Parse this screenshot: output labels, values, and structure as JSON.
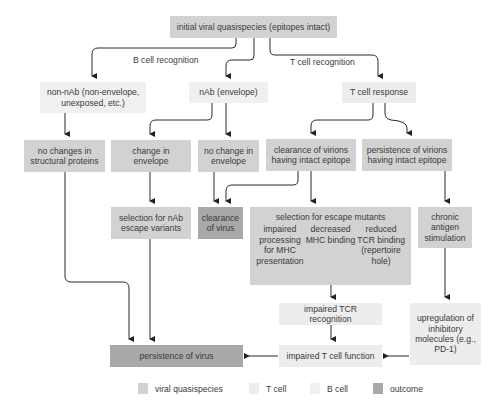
{
  "diagram": {
    "edge_labels": {
      "b_cell": "B cell recognition",
      "t_cell": "T cell recognition"
    },
    "nodes": {
      "initial": "initial viral quasispecies (epitopes intact)",
      "non_nab": "non-nAb (non-envelope, unexposed, etc.)",
      "nab": "nAb (envelope)",
      "t_response": "T cell response",
      "no_changes_structural": "no changes in structural proteins",
      "change_envelope": "change in envelope",
      "no_change_envelope": "no change in envelope",
      "clearance_virions": "clearance of virions having intact epitope",
      "persistence_virions": "persistence of virions having intact epitope",
      "selection_nab": "selection for nAb escape variants",
      "clearance_virus": "clearance of virus",
      "escape_mutants": {
        "title": "selection for escape mutants",
        "items": [
          "impaired processing for MHC presentation",
          "decreased MHC binding",
          "reduced TCR binding (repertoire hole)"
        ]
      },
      "chronic": "chronic antigen stimulation",
      "impaired_tcr": "impaired TCR recognition",
      "upregulation": "upregulation of inhibitory molecules (e.g., PD-1)",
      "impaired_tcell": "impaired T cell function",
      "persistence_virus": "persistence of virus"
    }
  },
  "legend": {
    "items": [
      {
        "label": "viral quasispecies",
        "color": "#d2d2d2"
      },
      {
        "label": "T cell",
        "color": "#ededed"
      },
      {
        "label": "B cell",
        "color": "#f0f0f0"
      },
      {
        "label": "outcome",
        "color": "#a9a9a9"
      }
    ]
  }
}
